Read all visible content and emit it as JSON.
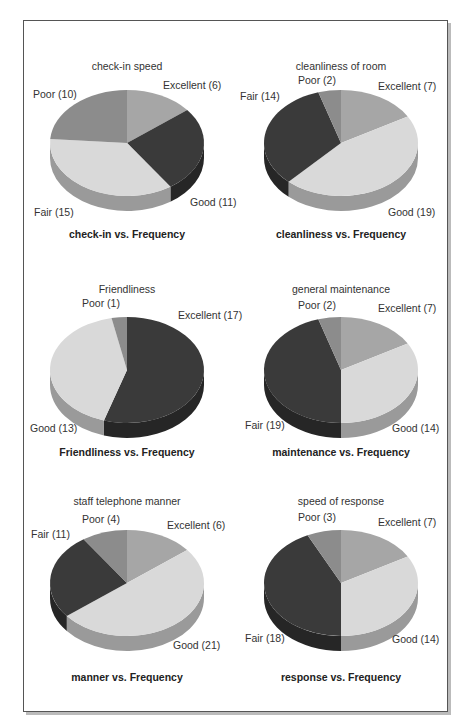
{
  "colors": {
    "dark": "#3a3a3a",
    "dark_side": "#262626",
    "medium": "#8c8c8c",
    "medium_side": "#6a6a6a",
    "excellent": "#a6a6a6",
    "excellent_side": "#7e7e7e",
    "light": "#d9d9d9",
    "light_side": "#9a9a9a"
  },
  "chart_data": [
    {
      "type": "pie",
      "title": "check-in speed",
      "caption": "check-in vs. Frequency",
      "categories": [
        "Excellent",
        "Good",
        "Fair",
        "Poor"
      ],
      "values": [
        6,
        11,
        15,
        10
      ],
      "labels": [
        "Excellent (6)",
        "Good (11)",
        "Fair (15)",
        "Poor (10)"
      ],
      "slice_colors": [
        "excellent",
        "dark",
        "light",
        "medium"
      ]
    },
    {
      "type": "pie",
      "title": "cleanliness of room",
      "caption": "cleanliness vs. Frequency",
      "categories": [
        "Excellent",
        "Good",
        "Fair",
        "Poor"
      ],
      "values": [
        7,
        19,
        14,
        2
      ],
      "labels": [
        "Excellent (7)",
        "Good (19)",
        "Fair (14)",
        "Poor (2)"
      ],
      "slice_colors": [
        "excellent",
        "light",
        "dark",
        "medium"
      ]
    },
    {
      "type": "pie",
      "title": "Friendliness",
      "caption": "Friendliness vs. Frequency",
      "categories": [
        "Excellent",
        "Good",
        "Fair",
        "Poor"
      ],
      "values": [
        17,
        13,
        0,
        1
      ],
      "labels": [
        "Excellent (17)",
        "Good (13)",
        "",
        "Poor (1)"
      ],
      "slice_colors": [
        "dark",
        "light",
        "medium",
        "medium"
      ]
    },
    {
      "type": "pie",
      "title": "general maintenance",
      "caption": "maintenance vs. Frequency",
      "categories": [
        "Excellent",
        "Good",
        "Fair",
        "Poor"
      ],
      "values": [
        7,
        14,
        19,
        2
      ],
      "labels": [
        "Excellent (7)",
        "Good (14)",
        "Fair (19)",
        "Poor (2)"
      ],
      "slice_colors": [
        "excellent",
        "light",
        "dark",
        "medium"
      ]
    },
    {
      "type": "pie",
      "title": "staff telephone manner",
      "caption": "manner vs. Frequency",
      "categories": [
        "Excellent",
        "Good",
        "Fair",
        "Poor"
      ],
      "values": [
        6,
        21,
        11,
        4
      ],
      "labels": [
        "Excellent (6)",
        "Good (21)",
        "Fair (11)",
        "Poor (4)"
      ],
      "slice_colors": [
        "excellent",
        "light",
        "dark",
        "medium"
      ]
    },
    {
      "type": "pie",
      "title": "speed of response",
      "caption": "response vs. Frequency",
      "categories": [
        "Excellent",
        "Good",
        "Fair",
        "Poor"
      ],
      "values": [
        7,
        14,
        18,
        3
      ],
      "labels": [
        "Excellent (7)",
        "Good (14)",
        "Fair (18)",
        "Poor (3)"
      ],
      "slice_colors": [
        "excellent",
        "light",
        "dark",
        "medium"
      ]
    }
  ],
  "layout": [
    {
      "cx": 127,
      "cy": 143,
      "title_y": 60,
      "caption_y": 228,
      "label_pos": [
        [
          163,
          79
        ],
        [
          190,
          196
        ],
        [
          34,
          206
        ],
        [
          33,
          88
        ]
      ]
    },
    {
      "cx": 341,
      "cy": 143,
      "title_y": 60,
      "caption_y": 228,
      "label_pos": [
        [
          378,
          80
        ],
        [
          388,
          206
        ],
        [
          240,
          90
        ],
        [
          298,
          74
        ]
      ]
    },
    {
      "cx": 127,
      "cy": 370,
      "title_y": 283,
      "caption_y": 446,
      "label_pos": [
        [
          178,
          309
        ],
        [
          30,
          422
        ],
        null,
        [
          82,
          297
        ]
      ]
    },
    {
      "cx": 341,
      "cy": 370,
      "title_y": 283,
      "caption_y": 446,
      "label_pos": [
        [
          378,
          302
        ],
        [
          392,
          422
        ],
        [
          245,
          419
        ],
        [
          298,
          299
        ]
      ]
    },
    {
      "cx": 127,
      "cy": 583,
      "title_y": 495,
      "caption_y": 671,
      "label_pos": [
        [
          167,
          519
        ],
        [
          173,
          639
        ],
        [
          31,
          528
        ],
        [
          82,
          513
        ]
      ]
    },
    {
      "cx": 341,
      "cy": 583,
      "title_y": 495,
      "caption_y": 671,
      "label_pos": [
        [
          378,
          516
        ],
        [
          392,
          633
        ],
        [
          245,
          632
        ],
        [
          298,
          511
        ]
      ]
    }
  ]
}
